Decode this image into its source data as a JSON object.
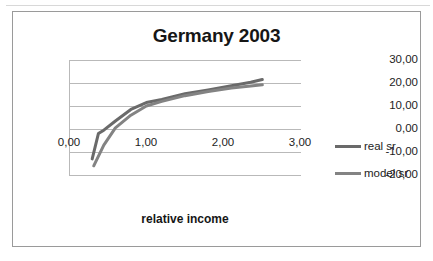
{
  "chart_data": {
    "type": "line",
    "title": "Germany 2003",
    "xlabel": "relative income",
    "ylabel": "",
    "xlim": [
      0.0,
      3.0
    ],
    "ylim": [
      -20.0,
      30.0
    ],
    "grid": true,
    "legend_position": "right",
    "x_ticks": [
      "0,00",
      "1,00",
      "2,00",
      "3,00"
    ],
    "x_tick_values": [
      0.0,
      1.0,
      2.0,
      3.0
    ],
    "y_ticks": [
      "30,00",
      "20,00",
      "10,00",
      "0,00",
      "-10,00",
      "-20,00"
    ],
    "y_tick_values": [
      30.0,
      20.0,
      10.0,
      0.0,
      -10.0,
      -20.0
    ],
    "series": [
      {
        "name": "real sr",
        "color": "#6a6a6a",
        "x": [
          0.3,
          0.38,
          0.45,
          0.6,
          0.8,
          1.0,
          1.2,
          1.5,
          1.8,
          2.1,
          2.35,
          2.5
        ],
        "values": [
          -13.0,
          -2.0,
          -0.5,
          3.5,
          8.5,
          11.5,
          12.8,
          15.3,
          17.0,
          18.8,
          20.3,
          21.5
        ]
      },
      {
        "name": "model sr",
        "color": "#838383",
        "x": [
          0.32,
          0.45,
          0.6,
          0.8,
          1.0,
          1.2,
          1.5,
          1.8,
          2.1,
          2.35,
          2.5
        ],
        "values": [
          -16.0,
          -7.0,
          0.5,
          6.0,
          10.0,
          12.0,
          14.5,
          16.3,
          17.8,
          18.7,
          19.2
        ]
      }
    ]
  },
  "legend": {
    "items": [
      {
        "label": "real sr",
        "color": "#6a6a6a"
      },
      {
        "label": "model sr",
        "color": "#838383"
      }
    ]
  }
}
